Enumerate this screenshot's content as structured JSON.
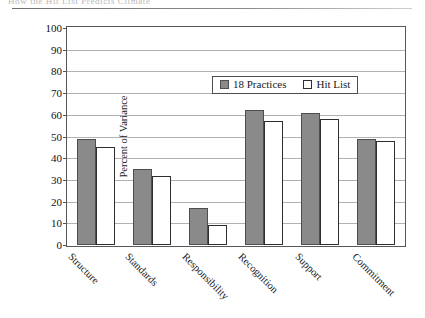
{
  "header": {
    "running_text": "How the  Hit List  Predicts Climate",
    "rule": "horizontal-rule"
  },
  "chart_data": {
    "type": "bar",
    "title": "",
    "subtitle": "",
    "xlabel": "",
    "ylabel": "Percent of Variance",
    "ylim": [
      0,
      100
    ],
    "ytick_step": 10,
    "yticks": [
      100,
      90,
      80,
      70,
      60,
      50,
      40,
      30,
      20,
      10,
      0
    ],
    "grid": true,
    "legend_position": "top-center-inside",
    "categories": [
      "Structure",
      "Standards",
      "Responsibility",
      "Recognition",
      "Support",
      "Commitment"
    ],
    "series": [
      {
        "name": "18 Practices",
        "color": "#8a8a8a",
        "values": [
          49,
          35,
          17,
          62,
          61,
          49
        ]
      },
      {
        "name": "Hit List",
        "color": "#ffffff",
        "values": [
          45,
          32,
          9,
          57,
          58,
          48
        ]
      }
    ]
  }
}
